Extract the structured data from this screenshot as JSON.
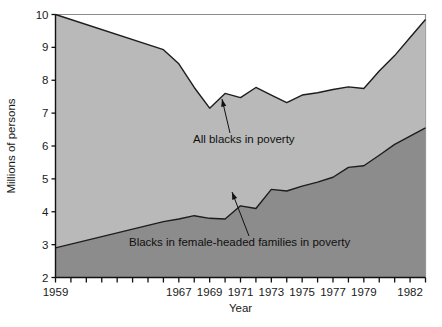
{
  "chart_data": {
    "type": "area",
    "title": "",
    "subtitle": "",
    "xlabel": "Year",
    "ylabel": "Millions of persons",
    "stacked": false,
    "grid": false,
    "legend_position": "inline-annotations",
    "xlim": [
      1959,
      1983
    ],
    "ylim": [
      2,
      10
    ],
    "y_ticks": [
      2,
      3,
      4,
      5,
      6,
      7,
      8,
      9,
      10
    ],
    "y_tick_labels": [
      "2",
      "3",
      "4",
      "5",
      "6",
      "7",
      "8",
      "9",
      "10"
    ],
    "x_ticks": [
      1959,
      1960,
      1961,
      1962,
      1963,
      1964,
      1965,
      1966,
      1967,
      1968,
      1969,
      1970,
      1971,
      1972,
      1973,
      1974,
      1975,
      1976,
      1977,
      1978,
      1979,
      1980,
      1981,
      1982,
      1983
    ],
    "x_tick_labels": [
      {
        "year": 1959,
        "label": "1959"
      },
      {
        "year": 1967,
        "label": "1967"
      },
      {
        "year": 1969,
        "label": "1969"
      },
      {
        "year": 1971,
        "label": "1971"
      },
      {
        "year": 1973,
        "label": "1973"
      },
      {
        "year": 1975,
        "label": "1975"
      },
      {
        "year": 1977,
        "label": "1977"
      },
      {
        "year": 1979,
        "label": "1979"
      },
      {
        "year": 1982,
        "label": "1982"
      }
    ],
    "x": [
      1959,
      1966,
      1967,
      1968,
      1969,
      1970,
      1971,
      1972,
      1973,
      1974,
      1975,
      1976,
      1977,
      1978,
      1979,
      1980,
      1981,
      1982,
      1983
    ],
    "series": [
      {
        "name": "All blacks in poverty",
        "color": "#b9b9b9",
        "line_color": "#1d1d1d",
        "values": [
          10.0,
          8.93,
          8.5,
          7.78,
          7.15,
          7.6,
          7.47,
          7.78,
          7.55,
          7.32,
          7.55,
          7.62,
          7.72,
          7.8,
          7.75,
          8.28,
          8.75,
          9.3,
          9.85
        ]
      },
      {
        "name": "Blacks in female-headed families in poverty",
        "color": "#8c8c8c",
        "line_color": "#1d1d1d",
        "values": [
          2.9,
          3.7,
          3.78,
          3.88,
          3.8,
          3.78,
          4.18,
          4.1,
          4.68,
          4.63,
          4.78,
          4.9,
          5.05,
          5.35,
          5.4,
          5.72,
          6.05,
          6.3,
          6.55
        ]
      }
    ],
    "annotations": [
      {
        "name": "all-blacks-in-poverty",
        "text": "All blacks in poverty",
        "text_x": 193,
        "text_y": 143,
        "arrow_from_x": 230,
        "arrow_from_y": 133,
        "arrow_to_x": 222,
        "arrow_to_y": 99
      },
      {
        "name": "blacks-in-female-headed-families-in-poverty",
        "text": "Blacks in female-headed families in poverty",
        "text_x": 129,
        "text_y": 246,
        "arrow_from_x": 249,
        "arrow_from_y": 236,
        "arrow_to_x": 232,
        "arrow_to_y": 192
      }
    ]
  }
}
